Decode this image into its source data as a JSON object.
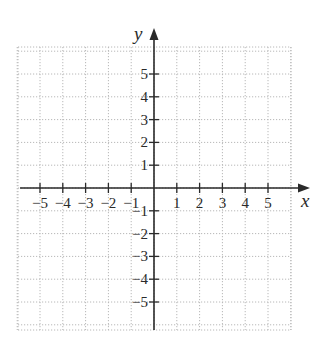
{
  "chart_data": {
    "type": "coordinate-plane",
    "title": "",
    "xlabel": "x",
    "ylabel": "y",
    "xlim": [
      -6,
      6
    ],
    "ylim": [
      -6,
      6
    ],
    "grid": true,
    "grid_style": "dotted",
    "x_ticks": [
      -5,
      -4,
      -3,
      -2,
      -1,
      1,
      2,
      3,
      4,
      5
    ],
    "y_ticks": [
      -5,
      -4,
      -3,
      -2,
      -1,
      1,
      2,
      3,
      4,
      5
    ],
    "x_tick_labels": [
      "−5",
      "−4",
      "−3",
      "−2",
      "−1",
      "1",
      "2",
      "3",
      "4",
      "5"
    ],
    "y_tick_labels": [
      "−5",
      "−4",
      "−3",
      "−2",
      "−1",
      "1",
      "2",
      "3",
      "4",
      "5"
    ],
    "series": []
  },
  "colors": {
    "axis": "#2a2a2a",
    "grid": "#b8b8b8",
    "background": "#ffffff"
  }
}
